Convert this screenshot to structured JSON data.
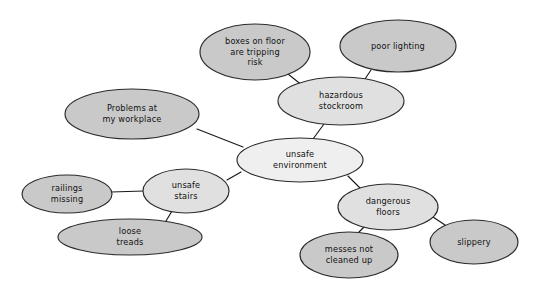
{
  "diagram": {
    "type": "mind-map",
    "background_color": "#ffffff",
    "stroke_color": "#2b2b2b",
    "text_color": "#111111",
    "fill_levels": {
      "center": "#efefef",
      "branch": "#e0e0e0",
      "leaf": "#c9c9c9"
    },
    "nodes": [
      {
        "id": "problems",
        "lines": [
          "Problems at",
          "my workplace"
        ],
        "cx": 132,
        "cy": 114,
        "rx": 67,
        "ry": 25,
        "fill": "#c9c9c9",
        "level": "leaf"
      },
      {
        "id": "boxes",
        "lines": [
          "boxes on floor",
          "are tripping",
          "risk"
        ],
        "cx": 255,
        "cy": 52,
        "rx": 55,
        "ry": 28,
        "fill": "#c9c9c9",
        "level": "leaf"
      },
      {
        "id": "poor-lighting",
        "lines": [
          "poor lighting"
        ],
        "cx": 398,
        "cy": 46,
        "rx": 58,
        "ry": 26,
        "fill": "#c9c9c9",
        "level": "leaf"
      },
      {
        "id": "hazardous-stockroom",
        "lines": [
          "hazardous",
          "stockroom"
        ],
        "cx": 341,
        "cy": 101,
        "rx": 63,
        "ry": 24,
        "fill": "#e0e0e0",
        "level": "branch"
      },
      {
        "id": "unsafe-environment",
        "lines": [
          "unsafe",
          "environment"
        ],
        "cx": 300,
        "cy": 160,
        "rx": 63,
        "ry": 22,
        "fill": "#efefef",
        "level": "center"
      },
      {
        "id": "unsafe-stairs",
        "lines": [
          "unsafe",
          "stairs"
        ],
        "cx": 186,
        "cy": 191,
        "rx": 43,
        "ry": 22,
        "fill": "#e0e0e0",
        "level": "branch"
      },
      {
        "id": "railings-missing",
        "lines": [
          "railings",
          "missing"
        ],
        "cx": 67,
        "cy": 194,
        "rx": 45,
        "ry": 19,
        "fill": "#c9c9c9",
        "level": "leaf"
      },
      {
        "id": "loose-treads",
        "lines": [
          "loose",
          "treads"
        ],
        "cx": 130,
        "cy": 237,
        "rx": 72,
        "ry": 18,
        "fill": "#c9c9c9",
        "level": "leaf"
      },
      {
        "id": "dangerous-floors",
        "lines": [
          "dangerous",
          "floors"
        ],
        "cx": 388,
        "cy": 207,
        "rx": 50,
        "ry": 23,
        "fill": "#e0e0e0",
        "level": "branch"
      },
      {
        "id": "messes-not-cleaned-up",
        "lines": [
          "messes not",
          "cleaned up"
        ],
        "cx": 349,
        "cy": 255,
        "rx": 49,
        "ry": 23,
        "fill": "#c9c9c9",
        "level": "leaf"
      },
      {
        "id": "slippery",
        "lines": [
          "slippery"
        ],
        "cx": 474,
        "cy": 242,
        "rx": 44,
        "ry": 22,
        "fill": "#c9c9c9",
        "level": "leaf"
      }
    ],
    "edges": [
      {
        "id": "edge-problems-center",
        "from": "problems",
        "to": "unsafe-environment",
        "x1": 197,
        "y1": 129,
        "x2": 243,
        "y2": 147
      },
      {
        "id": "edge-boxes-stockroom",
        "from": "boxes",
        "to": "hazardous-stockroom",
        "x1": 288,
        "y1": 74,
        "x2": 303,
        "y2": 86
      },
      {
        "id": "edge-lighting-stockroom",
        "from": "poor-lighting",
        "to": "hazardous-stockroom",
        "x1": 371,
        "y1": 70,
        "x2": 365,
        "y2": 79
      },
      {
        "id": "edge-stockroom-center",
        "from": "hazardous-stockroom",
        "to": "unsafe-environment",
        "x1": 324,
        "y1": 124,
        "x2": 313,
        "y2": 139
      },
      {
        "id": "edge-center-stairs",
        "from": "unsafe-environment",
        "to": "unsafe-stairs",
        "x1": 241,
        "y1": 172,
        "x2": 227,
        "y2": 180
      },
      {
        "id": "edge-railings-stairs",
        "from": "railings-missing",
        "to": "unsafe-stairs",
        "x1": 111,
        "y1": 192,
        "x2": 144,
        "y2": 191
      },
      {
        "id": "edge-stairs-treads",
        "from": "unsafe-stairs",
        "to": "loose-treads",
        "x1": 172,
        "y1": 211,
        "x2": 163,
        "y2": 226
      },
      {
        "id": "edge-center-floors",
        "from": "unsafe-environment",
        "to": "dangerous-floors",
        "x1": 348,
        "y1": 176,
        "x2": 361,
        "y2": 189
      },
      {
        "id": "edge-floors-messes",
        "from": "dangerous-floors",
        "to": "messes-not-cleaned-up",
        "x1": 364,
        "y1": 227,
        "x2": 357,
        "y2": 234
      },
      {
        "id": "edge-floors-slippery",
        "from": "dangerous-floors",
        "to": "slippery",
        "x1": 433,
        "y1": 217,
        "x2": 448,
        "y2": 227
      }
    ]
  }
}
